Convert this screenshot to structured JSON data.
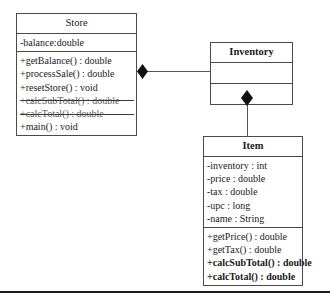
{
  "diagram": {
    "type": "uml-class-diagram",
    "classes": [
      {
        "id": "store",
        "name": "Store",
        "name_bold": false,
        "attributes": [
          {
            "text": "-balance:double",
            "bold": false,
            "struck": false
          }
        ],
        "methods": [
          {
            "text": "+getBalance() : double",
            "bold": false,
            "struck": false
          },
          {
            "text": "+processSale() : double",
            "bold": false,
            "struck": false
          },
          {
            "text": "+resetStore() : void",
            "bold": false,
            "struck": false
          },
          {
            "text": "+calcSubTotal() : double",
            "bold": false,
            "struck": true
          },
          {
            "text": "+calcTotal() : double",
            "bold": false,
            "struck": true
          },
          {
            "text": "+main() : void",
            "bold": false,
            "struck": false
          }
        ]
      },
      {
        "id": "inventory",
        "name": "Inventory",
        "name_bold": true,
        "attributes": [],
        "methods": []
      },
      {
        "id": "item",
        "name": "Item",
        "name_bold": true,
        "attributes": [
          {
            "text": "-inventory : int",
            "bold": false,
            "struck": false
          },
          {
            "text": "-price : double",
            "bold": false,
            "struck": false
          },
          {
            "text": "-tax : double",
            "bold": false,
            "struck": false
          },
          {
            "text": "-upc : long",
            "bold": false,
            "struck": false
          },
          {
            "text": "-name : String",
            "bold": false,
            "struck": false
          }
        ],
        "methods": [
          {
            "text": "+getPrice() : double",
            "bold": false,
            "struck": false
          },
          {
            "text": "+getTax() : double",
            "bold": false,
            "struck": false
          },
          {
            "text": "+calcSubTotal() : double",
            "bold": true,
            "struck": false
          },
          {
            "text": "+calcTotal() : double",
            "bold": true,
            "struck": false
          }
        ]
      }
    ],
    "relationships": [
      {
        "id": "store-inventory",
        "from": "Store",
        "to": "Inventory",
        "kind": "composition"
      },
      {
        "id": "inventory-item",
        "from": "Inventory",
        "to": "Item",
        "kind": "composition"
      }
    ],
    "colors": {
      "background": "#ffffff",
      "box_border": "#4a4a4a",
      "line": "#555555",
      "diamond_fill": "#111111",
      "text": "#1a1a1a",
      "struck_text": "#5e5e5e",
      "bottom_rule": "#1b1b1b"
    }
  }
}
